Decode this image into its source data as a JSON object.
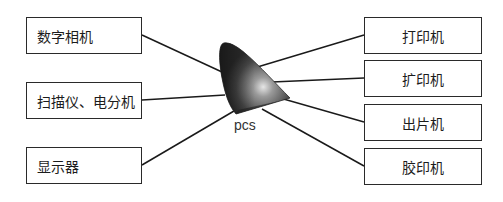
{
  "diagram": {
    "center": {
      "label": "pcs"
    },
    "inputs": [
      {
        "label": "数字相机"
      },
      {
        "label": "扫描仪、电分机"
      },
      {
        "label": "显示器"
      }
    ],
    "outputs": [
      {
        "label": "打印机"
      },
      {
        "label": "扩印机"
      },
      {
        "label": "出片机"
      },
      {
        "label": "胶印机"
      }
    ],
    "colors": {
      "line": "#1a1a1a",
      "box_border": "#2a2a2a",
      "gamut_dark": "#3a3a3a",
      "gamut_light": "#d8d8d8"
    }
  }
}
